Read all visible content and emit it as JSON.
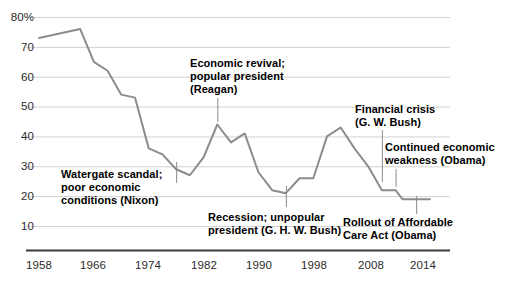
{
  "chart_data": {
    "type": "line",
    "title": "",
    "subtitle": "",
    "xlabel": "",
    "ylabel": "",
    "xlim": [
      1958,
      2016
    ],
    "ylim": [
      0,
      80
    ],
    "grid": true,
    "legend": "none",
    "y_ticks": [
      "80%",
      "70",
      "60",
      "50",
      "40",
      "30",
      "20",
      "10"
    ],
    "y_tick_values": [
      80,
      70,
      60,
      50,
      40,
      30,
      20,
      10
    ],
    "x_ticks": [
      "1958",
      "1966",
      "1974",
      "1982",
      "1990",
      "1998",
      "2008",
      "2014"
    ],
    "x_tick_values": [
      1958,
      1966,
      1974,
      1982,
      1990,
      1998,
      2008,
      2014
    ],
    "series": [
      {
        "name": "Trust in government",
        "color": "#8c8c8c",
        "x": [
          1958,
          1964,
          1966,
          1968,
          1970,
          1972,
          1974,
          1976,
          1978,
          1980,
          1982,
          1984,
          1986,
          1988,
          1990,
          1992,
          1994,
          1996,
          1998,
          2000,
          2002,
          2004,
          2006,
          2008,
          2010,
          2011,
          2013,
          2015
        ],
        "values": [
          73,
          76,
          65,
          62,
          54,
          53,
          36,
          34,
          29,
          27,
          33,
          44,
          38,
          41,
          28,
          22,
          21,
          26,
          26,
          40,
          43,
          36,
          30,
          22,
          22,
          19,
          19,
          19
        ]
      }
    ],
    "annotations": [
      {
        "id": "watergate",
        "text": "Watergate scandal;\npoor economic\nconditions (Nixon)",
        "point_year": 1978,
        "point_value": 29
      },
      {
        "id": "reagan",
        "text": "Economic revival;\npopular president\n(Reagan)",
        "point_year": 1984,
        "point_value": 44
      },
      {
        "id": "ghw-bush",
        "text": "Recession; unpopular\npresident (G. H. W. Bush)",
        "point_year": 1994,
        "point_value": 21
      },
      {
        "id": "financial-crisis",
        "text": "Financial crisis\n(G. W. Bush)",
        "point_year": 2008,
        "point_value": 22
      },
      {
        "id": "obama-weakness",
        "text": "Continued economic\nweakness (Obama)",
        "point_year": 2010,
        "point_value": 22
      },
      {
        "id": "aca-rollout",
        "text": "Rollout of Affordable\nCare Act (Obama)",
        "point_year": 2013,
        "point_value": 19
      }
    ]
  },
  "axis": {
    "y_80": "80%",
    "y_70": "70",
    "y_60": "60",
    "y_50": "50",
    "y_40": "40",
    "y_30": "30",
    "y_20": "20",
    "y_10": "10",
    "x_1958": "1958",
    "x_1966": "1966",
    "x_1974": "1974",
    "x_1982": "1982",
    "x_1990": "1990",
    "x_1998": "1998",
    "x_2008": "2008",
    "x_2014": "2014"
  },
  "annotations": {
    "watergate": "Watergate scandal;\npoor economic\nconditions (Nixon)",
    "reagan": "Economic revival;\npopular president\n(Reagan)",
    "ghw_bush": "Recession; unpopular\npresident (G. H. W. Bush)",
    "financial_crisis": "Financial crisis\n(G. W. Bush)",
    "obama_weakness": "Continued economic\nweakness (Obama)",
    "aca_rollout": "Rollout of Affordable\nCare Act (Obama)"
  },
  "colors": {
    "line": "#8c8c8c",
    "grid": "#d2d2d2",
    "axis": "#3a3a3a",
    "text": "#2b2b2b",
    "annotation_text": "#000000",
    "leader": "#8a8a8a"
  }
}
